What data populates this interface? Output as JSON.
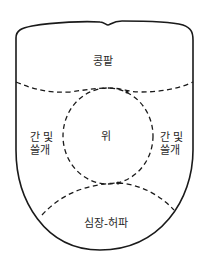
{
  "diagram": {
    "type": "tongue-organ-zone-map",
    "regions": {
      "top": {
        "label": "콩팥"
      },
      "left": {
        "label": "간 및\n  쓸개"
      },
      "right": {
        "label": "간 및\n  쓸개"
      },
      "center": {
        "label": "위"
      },
      "bottom": {
        "label": "심장-허파"
      }
    },
    "colors": {
      "line": "#1a1a1a",
      "text": "#2a2a2a",
      "background": "#ffffff"
    }
  }
}
